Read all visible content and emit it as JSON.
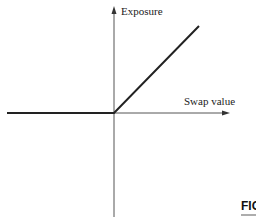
{
  "diagram": {
    "title": "",
    "y_axis": {
      "label": "Exposure"
    },
    "x_axis": {
      "label": "Swap value"
    },
    "payoff_line": {
      "description": "Exposure = max(Swap value, 0)"
    },
    "colors": {
      "axis": "#555555",
      "payoff": "#222222",
      "text": "#222222"
    }
  },
  "caption": {
    "figure_label": "FIG"
  }
}
